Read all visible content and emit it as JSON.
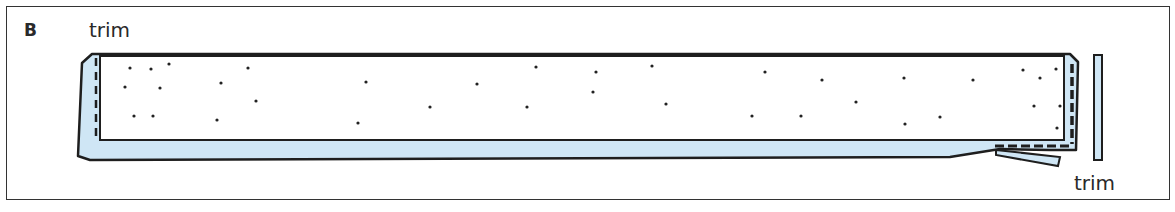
{
  "panel": {
    "label": "B"
  },
  "labels": {
    "trim_left": "trim",
    "trim_right": "trim"
  },
  "colors": {
    "fabric": "#cfe6f5",
    "outline": "#1e1e1e",
    "background": "#ffffff"
  },
  "dots": [
    [
      130,
      68
    ],
    [
      151,
      69
    ],
    [
      169,
      64
    ],
    [
      248,
      68
    ],
    [
      125,
      87
    ],
    [
      160,
      88
    ],
    [
      221,
      83
    ],
    [
      256,
      101
    ],
    [
      134,
      116
    ],
    [
      153,
      116
    ],
    [
      217,
      120
    ],
    [
      366,
      82
    ],
    [
      358,
      123
    ],
    [
      430,
      107
    ],
    [
      477,
      84
    ],
    [
      536,
      67
    ],
    [
      527,
      107
    ],
    [
      596,
      72
    ],
    [
      593,
      92
    ],
    [
      652,
      66
    ],
    [
      666,
      104
    ],
    [
      752,
      116
    ],
    [
      765,
      72
    ],
    [
      801,
      116
    ],
    [
      822,
      80
    ],
    [
      856,
      102
    ],
    [
      904,
      78
    ],
    [
      905,
      124
    ],
    [
      940,
      117
    ],
    [
      973,
      80
    ],
    [
      1023,
      70
    ],
    [
      1040,
      78
    ],
    [
      1056,
      69
    ],
    [
      1034,
      106
    ],
    [
      1060,
      106
    ],
    [
      1057,
      128
    ]
  ]
}
